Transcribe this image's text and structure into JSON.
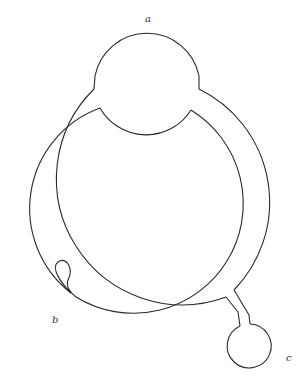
{
  "diagram": {
    "labels": {
      "a": "a",
      "b": "b",
      "c": "c"
    },
    "colors": {
      "stroke": "#2a2a2a",
      "background": "#ffffff",
      "label": "#333333"
    }
  }
}
